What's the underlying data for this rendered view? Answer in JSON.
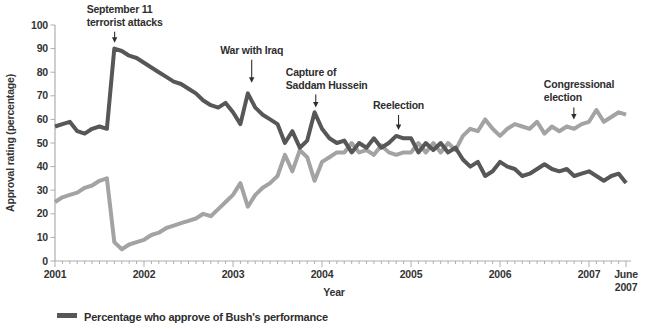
{
  "chart_data": {
    "type": "line",
    "title": "",
    "xlabel": "Year",
    "ylabel": "Approval rating (percentage)",
    "x_unit": "monthly",
    "x_start_year": 2001,
    "x_year_tick_labels": [
      "2001",
      "2002",
      "2003",
      "2004",
      "2005",
      "2006",
      "2007"
    ],
    "x_end_label_lines": [
      "June",
      "2007"
    ],
    "ylim": [
      0,
      100
    ],
    "y_ticks": [
      0,
      10,
      20,
      30,
      40,
      50,
      60,
      70,
      80,
      90,
      100
    ],
    "grid": false,
    "axis_color": "#aeaeae",
    "series": [
      {
        "name": "disapprove",
        "color": "#a3a3a3",
        "values": [
          25,
          27,
          28,
          29,
          31,
          32,
          34,
          35,
          8,
          5,
          7,
          8,
          9,
          11,
          12,
          14,
          15,
          16,
          17,
          18,
          20,
          19,
          22,
          25,
          28,
          33,
          23,
          28,
          31,
          33,
          36,
          45,
          38,
          47,
          44,
          34,
          42,
          44,
          46,
          46,
          50,
          46,
          47,
          45,
          49,
          46,
          45,
          46,
          46,
          50,
          46,
          50,
          46,
          50,
          47,
          53,
          56,
          55,
          60,
          56,
          53,
          56,
          58,
          57,
          56,
          59,
          54,
          57,
          55,
          57,
          56,
          58,
          59,
          64,
          59,
          61,
          63,
          62
        ]
      },
      {
        "name": "approve",
        "color": "#575757",
        "values": [
          57,
          58,
          59,
          55,
          54,
          56,
          57,
          56,
          90,
          89,
          87,
          86,
          84,
          82,
          80,
          78,
          76,
          75,
          73,
          71,
          68,
          66,
          65,
          67,
          63,
          58,
          71,
          65,
          62,
          60,
          58,
          50,
          55,
          48,
          51,
          63,
          56,
          52,
          50,
          51,
          46,
          50,
          48,
          52,
          48,
          50,
          53,
          52,
          52,
          46,
          50,
          47,
          50,
          46,
          48,
          43,
          40,
          42,
          36,
          38,
          42,
          40,
          39,
          36,
          37,
          39,
          41,
          39,
          38,
          39,
          36,
          37,
          38,
          36,
          34,
          36,
          37,
          33
        ]
      }
    ],
    "annotations": [
      {
        "lines": [
          "September 11",
          "terrorist attacks"
        ],
        "x": 2001.67,
        "y": 92.5,
        "arrow_len": 11,
        "dx": -28,
        "align": "left"
      },
      {
        "lines": [
          "War with Iraq"
        ],
        "x": 2003.21,
        "y": 75.5,
        "arrow_len": 23,
        "dx": 0,
        "align": "center"
      },
      {
        "lines": [
          "Capture of",
          "Saddam Hussein"
        ],
        "x": 2003.93,
        "y": 65,
        "arrow_len": 13,
        "dx": -30,
        "align": "left"
      },
      {
        "lines": [
          "Reelection"
        ],
        "x": 2004.86,
        "y": 55.5,
        "arrow_len": 15,
        "dx": 0,
        "align": "center"
      },
      {
        "lines": [
          "Congressional",
          "election"
        ],
        "x": 2006.83,
        "y": 60,
        "arrow_len": 12,
        "dx": -30,
        "align": "left"
      }
    ]
  },
  "legend": {
    "items": [
      {
        "label": "Percentage who approve of Bush's performance",
        "color": "#575757"
      }
    ]
  }
}
